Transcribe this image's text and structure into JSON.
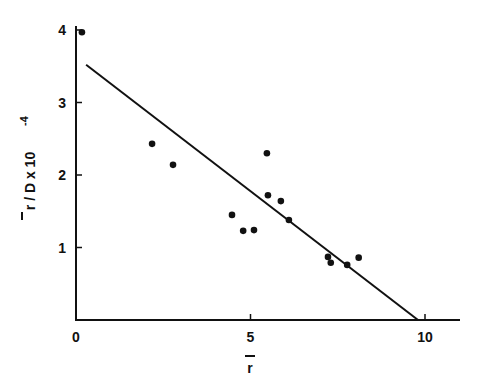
{
  "chart_data": {
    "type": "scatter",
    "title": "",
    "xlabel": "r̄",
    "ylabel": "r̄ / D x 10⁻⁴",
    "xlim": [
      0,
      11
    ],
    "ylim": [
      0,
      4.1
    ],
    "xticks": [
      0,
      5,
      10
    ],
    "yticks": [
      1,
      2,
      3,
      4
    ],
    "grid": false,
    "legend": null,
    "series": [
      {
        "name": "data",
        "kind": "scatter",
        "points": [
          {
            "x": 0.17,
            "y": 3.97
          },
          {
            "x": 2.18,
            "y": 2.43
          },
          {
            "x": 2.78,
            "y": 2.14
          },
          {
            "x": 4.47,
            "y": 1.45
          },
          {
            "x": 4.79,
            "y": 1.23
          },
          {
            "x": 5.1,
            "y": 1.24
          },
          {
            "x": 5.47,
            "y": 2.3
          },
          {
            "x": 5.5,
            "y": 1.72
          },
          {
            "x": 5.87,
            "y": 1.64
          },
          {
            "x": 6.1,
            "y": 1.38
          },
          {
            "x": 7.22,
            "y": 0.87
          },
          {
            "x": 7.3,
            "y": 0.79
          },
          {
            "x": 7.77,
            "y": 0.76
          },
          {
            "x": 8.1,
            "y": 0.86
          }
        ]
      },
      {
        "name": "fit",
        "kind": "line",
        "points": [
          {
            "x": 0.29,
            "y": 3.52
          },
          {
            "x": 9.8,
            "y": 0.0
          }
        ]
      }
    ]
  },
  "axes": {
    "x_tick_labels": [
      "0",
      "5",
      "10"
    ],
    "y_tick_labels": [
      "1",
      "2",
      "3",
      "4"
    ],
    "x_title": "r",
    "y_title": "r / D x 10",
    "y_exponent": "-4"
  }
}
